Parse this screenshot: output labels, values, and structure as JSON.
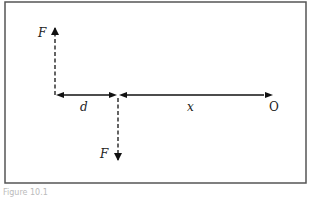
{
  "diagram": {
    "labels": {
      "force_top": "F",
      "force_bottom": "F",
      "distance_d": "d",
      "distance_x": "x",
      "origin": "O"
    },
    "caption": "Figure 10.1",
    "colors": {
      "stroke": "#111111",
      "frame": "#555555",
      "background": "#ffffff"
    }
  }
}
